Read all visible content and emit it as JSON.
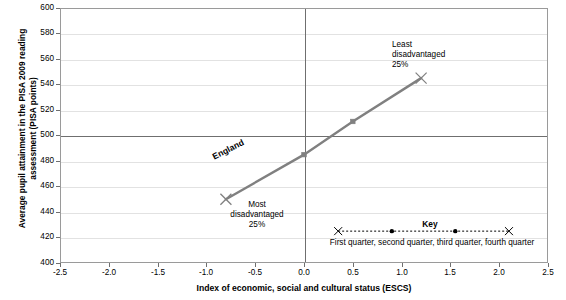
{
  "chart_data": {
    "type": "line",
    "title": "",
    "xlabel": "Index of economic, social and cultural status (ESCS)",
    "ylabel": "Average pupil attainment in the PISA 2009 reading\nassessment (PISA points)",
    "xlim": [
      -2.5,
      2.5
    ],
    "ylim": [
      400,
      600
    ],
    "xticks": [
      "-2.5",
      "-2.0",
      "-1.5",
      "-1.0",
      "-0.5",
      "0.0",
      "0.5",
      "1.0",
      "1.5",
      "2.0",
      "2.5"
    ],
    "xtick_values": [
      -2.5,
      -2.0,
      -1.5,
      -1.0,
      -0.5,
      0.0,
      0.5,
      1.0,
      1.5,
      2.0,
      2.5
    ],
    "yticks": [
      "400",
      "420",
      "440",
      "460",
      "480",
      "500",
      "520",
      "540",
      "560",
      "580",
      "600"
    ],
    "ytick_values": [
      400,
      420,
      440,
      460,
      480,
      500,
      520,
      540,
      560,
      580,
      600
    ],
    "grid": true,
    "legend_position": "inside-bottom-right",
    "series": [
      {
        "name": "England",
        "color": "#808080",
        "x": [
          -0.8,
          0.0,
          0.5,
          1.2
        ],
        "values": [
          450,
          485,
          511,
          545
        ],
        "markers": [
          "x",
          "dot",
          "dot",
          "x"
        ],
        "point_labels": [
          "First quarter",
          "second quarter",
          "third quarter",
          "fourth quarter"
        ]
      }
    ],
    "reference_lines": [
      {
        "name": "oecd-average",
        "orientation": "horizontal",
        "value": 500
      },
      {
        "name": "escs-zero",
        "orientation": "vertical",
        "value": 0.0
      }
    ],
    "annotations": [
      {
        "name": "most-disadvantaged",
        "text": "Most\ndisadvantaged\n25%",
        "x": -0.8,
        "y": 450
      },
      {
        "name": "least-disadvantaged",
        "text": "Least\ndisadvantaged\n25%",
        "x": 1.2,
        "y": 545
      },
      {
        "name": "series-label",
        "text": "England",
        "x": -0.35,
        "y": 470
      }
    ]
  },
  "key": {
    "title": "Key",
    "caption": "First quarter,  second quarter,  third quarter,  fourth quarter",
    "x_range": [
      0.35,
      2.1
    ],
    "y_value": 425,
    "marker_x": [
      0.35,
      0.9,
      1.55,
      2.1
    ],
    "marker_types": [
      "x",
      "dot",
      "dot",
      "x"
    ],
    "line_style": "dotted",
    "color": "#000000"
  }
}
